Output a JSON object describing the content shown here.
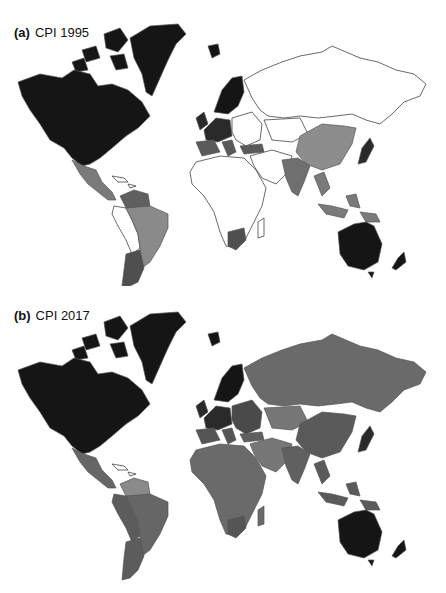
{
  "figure": {
    "panels": [
      {
        "tag": "(a)",
        "title": "CPI 1995",
        "colors": {
          "north_america": "#151515",
          "greenland": "#151515",
          "mexico_central_america": "#7a7a7a",
          "caribbean": "#ffffff",
          "venezuela": "#5f5f5f",
          "colombia_peru_bolivia": "#ffffff",
          "brazil": "#8a8a8a",
          "argentina_chile": "#4f4f4f",
          "scandinavia": "#151515",
          "western_europe": "#2a2a2a",
          "southern_europe": "#5a5a5a",
          "eastern_europe": "#ffffff",
          "russia": "#ffffff",
          "turkey": "#5a5a5a",
          "middle_east": "#ffffff",
          "africa": "#ffffff",
          "south_africa": "#4f4f4f",
          "china": "#8d8d8d",
          "india": "#6f6f6f",
          "southeast_asia": "#7a7a7a",
          "japan": "#2a2a2a",
          "australia": "#151515",
          "new_zealand": "#151515"
        }
      },
      {
        "tag": "(b)",
        "title": "CPI 2017",
        "colors": {
          "north_america": "#151515",
          "greenland": "#151515",
          "mexico_central_america": "#666666",
          "caribbean": "#ffffff",
          "venezuela": "#8a8a8a",
          "colombia_peru_bolivia": "#5c5c5c",
          "brazil": "#666666",
          "argentina_chile": "#5c5c5c",
          "scandinavia": "#151515",
          "western_europe": "#2a2a2a",
          "southern_europe": "#555555",
          "eastern_europe": "#4a4a4a",
          "russia": "#6a6a6a",
          "turkey": "#5f5f5f",
          "middle_east": "#777777",
          "africa": "#6a6a6a",
          "south_africa": "#555555",
          "china": "#5a5a5a",
          "india": "#606060",
          "southeast_asia": "#5a5a5a",
          "japan": "#2a2a2a",
          "australia": "#151515",
          "new_zealand": "#151515"
        }
      }
    ]
  }
}
